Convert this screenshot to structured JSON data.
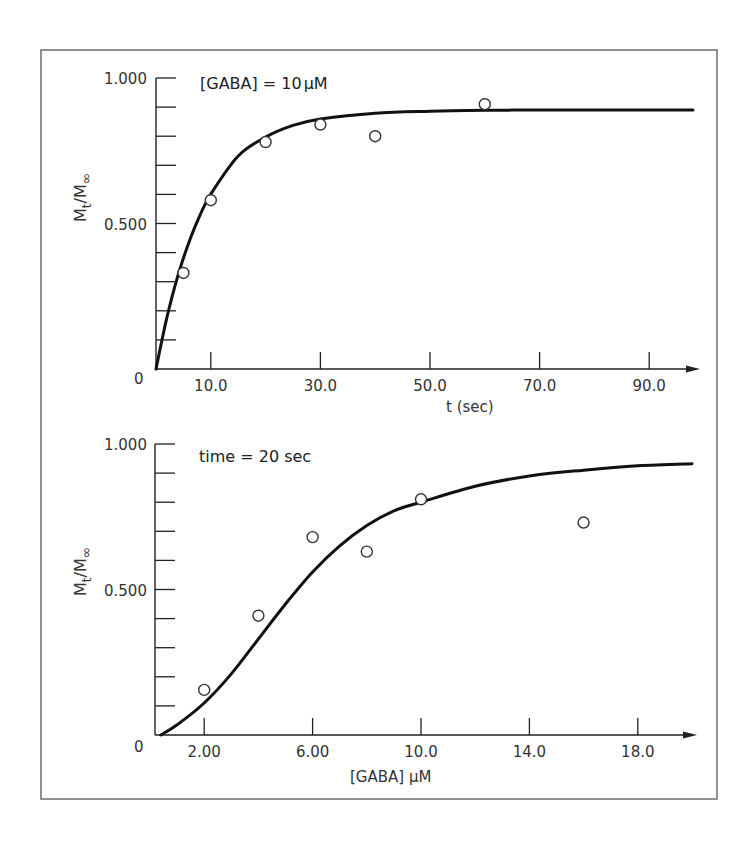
{
  "chart_data": [
    {
      "type": "scatter",
      "panel": "top",
      "title": "",
      "annotation": "[GABA] = 10 µM",
      "xlabel": "t (sec)",
      "ylabel": "M_t / M_∞",
      "xlim": [
        0,
        100
      ],
      "ylim": [
        0,
        1.0
      ],
      "x_ticks": [
        10.0,
        30.0,
        50.0,
        70.0,
        90.0
      ],
      "x_tick_labels": [
        "10.0",
        "30.0",
        "50.0",
        "70.0",
        "90.0"
      ],
      "x_minor_ticks": [],
      "y_tick_labels": [
        "0",
        "0.500",
        "1.000"
      ],
      "y_ticks_major": [
        0,
        0.5,
        1.0
      ],
      "y_minor_step": 0.1,
      "grid": false,
      "series": [
        {
          "name": "observed",
          "marker": "open-circle",
          "x": [
            5,
            10,
            20,
            30,
            40,
            60
          ],
          "y": [
            0.33,
            0.58,
            0.78,
            0.84,
            0.8,
            0.91
          ]
        },
        {
          "name": "fit",
          "style": "line",
          "model": "y = 0.89 * (1 - exp(-t/8.9))",
          "x": [
            0,
            2,
            4,
            6,
            8,
            10,
            15,
            20,
            25,
            30,
            40,
            50,
            60,
            70,
            80,
            90,
            98
          ],
          "y": [
            0,
            0.178,
            0.321,
            0.435,
            0.527,
            0.601,
            0.732,
            0.797,
            0.837,
            0.859,
            0.879,
            0.886,
            0.889,
            0.89,
            0.89,
            0.89,
            0.89
          ]
        }
      ]
    },
    {
      "type": "scatter",
      "panel": "bottom",
      "title": "",
      "annotation": "time = 20 sec",
      "xlabel": "[GABA] µM",
      "ylabel": "M_t / M_∞",
      "xlim": [
        0,
        20
      ],
      "ylim": [
        0,
        1.0
      ],
      "x_ticks": [
        2.0,
        6.0,
        10.0,
        14.0,
        18.0
      ],
      "x_tick_labels": [
        "2.00",
        "6.00",
        "10.0",
        "14.0",
        "18.0"
      ],
      "y_tick_labels": [
        "0",
        "0.500",
        "1.000"
      ],
      "y_ticks_major": [
        0,
        0.5,
        1.0
      ],
      "y_minor_step": 0.1,
      "grid": false,
      "series": [
        {
          "name": "observed",
          "marker": "open-circle",
          "x": [
            2,
            4,
            6,
            8,
            10,
            16
          ],
          "y": [
            0.155,
            0.41,
            0.68,
            0.63,
            0.81,
            0.73
          ]
        },
        {
          "name": "fit",
          "style": "line",
          "x": [
            0.4,
            1,
            2,
            3,
            4,
            5,
            6,
            7,
            8,
            9,
            10,
            12,
            14,
            16,
            18,
            20
          ],
          "y": [
            0.0,
            0.035,
            0.11,
            0.21,
            0.33,
            0.45,
            0.56,
            0.65,
            0.72,
            0.77,
            0.8,
            0.855,
            0.89,
            0.91,
            0.925,
            0.932
          ]
        }
      ]
    }
  ],
  "labels": {
    "top": {
      "annotation": "[GABA] = 10",
      "annotation_unit": "µM",
      "y_top": "1.000",
      "y_mid": "0.500",
      "origin": "0",
      "ylabel_main": "M",
      "ylabel_sub_t": "t",
      "ylabel_sep": "/",
      "ylabel_sub_inf": "∞",
      "xlabel": "t  (sec)",
      "x_ticks": [
        "10.0",
        "30.0",
        "50.0",
        "70.0",
        "90.0"
      ]
    },
    "bottom": {
      "annotation": "time = 20 sec",
      "y_top": "1.000",
      "y_mid": "0.500",
      "origin": "0",
      "ylabel_main": "M",
      "ylabel_sub_t": "t",
      "ylabel_sep": "/",
      "ylabel_sub_inf": "∞",
      "xlabel": "[GABA] µM",
      "x_ticks": [
        "2.00",
        "6.00",
        "10.0",
        "14.0",
        "18.0"
      ]
    }
  }
}
